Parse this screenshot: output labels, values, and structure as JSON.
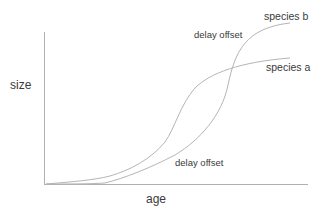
{
  "diagram": {
    "xlabel": "age",
    "ylabel": "size",
    "annotations": {
      "delay_top": "delay offset",
      "delay_bottom": "delay offset"
    },
    "series": [
      {
        "name": "species a",
        "label": "species a"
      },
      {
        "name": "species b",
        "label": "species b"
      }
    ],
    "colors": {
      "axis": "#b0b0b0",
      "curve": "#b5b5b5",
      "text": "#3a3a3a"
    }
  }
}
